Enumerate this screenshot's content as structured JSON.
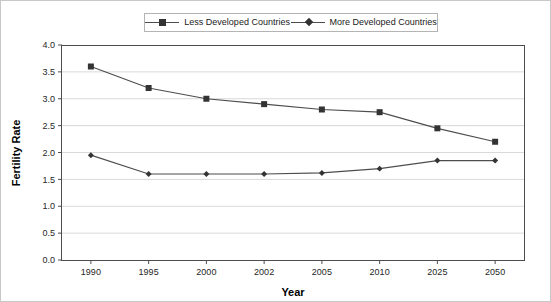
{
  "chart_data": {
    "type": "line",
    "title": "",
    "xlabel": "Year",
    "ylabel": "Fertility Rate",
    "categories": [
      "1990",
      "1995",
      "2000",
      "2002",
      "2005",
      "2010",
      "2025",
      "2050"
    ],
    "series": [
      {
        "name": "Less Developed Countries",
        "marker": "square",
        "color": "#4d4d4d",
        "values": [
          3.6,
          3.2,
          3.0,
          2.9,
          2.8,
          2.75,
          2.45,
          2.2
        ]
      },
      {
        "name": "More Developed Countries",
        "marker": "diamond",
        "color": "#4d4d4d",
        "values": [
          1.95,
          1.6,
          1.6,
          1.6,
          1.62,
          1.7,
          1.85,
          1.85
        ]
      }
    ],
    "ylim": [
      0.0,
      4.0
    ],
    "ytick_step": 0.5,
    "yticks": [
      "0.0",
      "0.5",
      "1.0",
      "1.5",
      "2.0",
      "2.5",
      "3.0",
      "3.5",
      "4.0"
    ],
    "grid": true,
    "grid_axis": "y",
    "legend_position": "top-center",
    "legend_entries": [
      "Less Developed Countries",
      "More Developed Countries"
    ]
  },
  "legend": {
    "entry_0": "Less Developed Countries",
    "entry_1": "More Developed Countries"
  },
  "axes": {
    "y_title": "Fertility Rate",
    "x_title": "Year"
  }
}
